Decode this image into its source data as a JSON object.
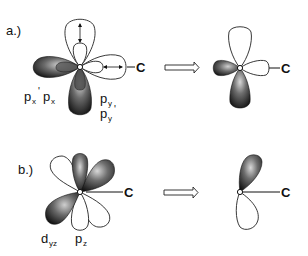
{
  "panels": [
    {
      "id": "a",
      "label": "a.)",
      "atom_label": "C",
      "orbital_labels": {
        "px_prime": "p",
        "px_prime_sub": "x",
        "px_prime_mark": "'",
        "px": "p",
        "px_sub": "x",
        "py": "p",
        "py_sub": "y",
        "py_prime": "p",
        "py_prime_sub": "y",
        "py_prime_mark": "'"
      },
      "result_atom_label": "C"
    },
    {
      "id": "b",
      "label": "b.)",
      "atom_label": "C",
      "orbital_labels": {
        "dyz": "d",
        "dyz_sub": "yz",
        "pz": "p",
        "pz_sub": "z"
      },
      "result_atom_label": "C"
    }
  ],
  "colors": {
    "dark_lobe": "#1a1a1a",
    "light_lobe": "#ffffff",
    "outline": "#222222"
  }
}
